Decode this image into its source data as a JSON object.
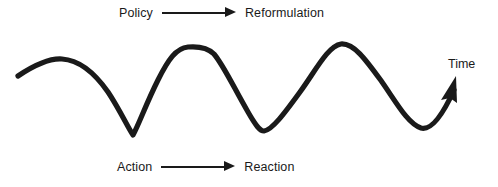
{
  "figure": {
    "background_color": "#ffffff",
    "ink_color": "#1a1a1a",
    "width": 498,
    "height": 187
  },
  "top_relation": {
    "source_label": "Policy",
    "arrow_icon": "right-arrow-icon",
    "target_label": "Reformulation"
  },
  "bottom_relation": {
    "source_label": "Action",
    "arrow_icon": "right-arrow-icon",
    "target_label": "Reaction"
  },
  "axis": {
    "time_label": "Time",
    "arrow_icon": "up-right-arrow-icon"
  },
  "chart_data": {
    "type": "line",
    "title": "",
    "xlabel": "Time",
    "ylabel": "",
    "grid": false,
    "legend": null,
    "annotations": [
      "Policy → Reformulation",
      "Action → Reaction",
      "Time"
    ],
    "series": [
      {
        "name": "oscillating-trend",
        "points": [
          [
            18,
            76
          ],
          [
            40,
            64
          ],
          [
            62,
            59
          ],
          [
            85,
            63
          ],
          [
            108,
            88
          ],
          [
            124,
            118
          ],
          [
            133,
            135
          ],
          [
            142,
            112
          ],
          [
            158,
            75
          ],
          [
            172,
            57
          ],
          [
            186,
            47
          ],
          [
            212,
            47
          ],
          [
            228,
            70
          ],
          [
            244,
            104
          ],
          [
            254,
            123
          ],
          [
            263,
            131
          ],
          [
            278,
            122
          ],
          [
            300,
            90
          ],
          [
            320,
            60
          ],
          [
            340,
            44
          ],
          [
            360,
            50
          ],
          [
            382,
            76
          ],
          [
            400,
            104
          ],
          [
            412,
            122
          ],
          [
            422,
            128
          ],
          [
            434,
            121
          ],
          [
            446,
            103
          ],
          [
            455,
            84
          ]
        ],
        "path": "M18,76 C30,68 48,58 62,59 C78,60 94,72 108,92 C120,110 128,128 133,135 C139,124 146,104 158,80 C168,60 176,48 188,47 C200,46 208,48 214,54 C224,66 234,88 248,112 C256,126 260,131 264,131 C272,130 284,114 300,92 C316,70 328,46 341,44 C354,43 366,60 382,82 C396,102 408,124 421,128 C432,131 444,112 454,90",
        "stroke_width": 5.2,
        "stroke_color": "#1a1a1a",
        "arrow_end": true
      }
    ],
    "xlim": [
      0,
      498
    ],
    "ylim": [
      187,
      0
    ]
  }
}
